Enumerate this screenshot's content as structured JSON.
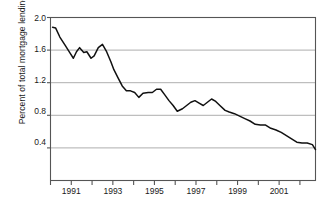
{
  "chart_data": {
    "type": "line",
    "title": "",
    "subtitle": "",
    "xlabel": "",
    "ylabel": "Percent of total mortgage lending",
    "ylim": [
      0.0,
      2.0
    ],
    "xlim": [
      1990.0,
      2002.75
    ],
    "yticks": [
      "2.0",
      "1.6",
      "1.2",
      "0.8",
      "0.4"
    ],
    "ytick_values": [
      2.0,
      1.6,
      1.2,
      0.8,
      0.4
    ],
    "xticks": [
      "1991",
      "1993",
      "1995",
      "1997",
      "1999",
      "2001"
    ],
    "xtick_values": [
      1991,
      1993,
      1995,
      1997,
      1999,
      2001
    ],
    "xtick_minor_values": [
      1990,
      1991,
      1992,
      1993,
      1994,
      1995,
      1996,
      1997,
      1998,
      1999,
      2000,
      2001,
      2002
    ],
    "grid": "horizontal",
    "legend": "none",
    "line_color": "#111111",
    "grid_color": "#999999",
    "axis_color": "#555555",
    "series": [
      {
        "name": "Percent of total mortgage lending",
        "x": [
          1990.1,
          1990.25,
          1990.45,
          1990.7,
          1990.95,
          1991.1,
          1991.25,
          1991.4,
          1991.6,
          1991.75,
          1991.95,
          1992.1,
          1992.3,
          1992.5,
          1992.7,
          1992.9,
          1993.05,
          1993.25,
          1993.45,
          1993.65,
          1993.85,
          1994.05,
          1994.25,
          1994.45,
          1994.7,
          1994.9,
          1995.1,
          1995.3,
          1995.5,
          1995.7,
          1995.9,
          1996.1,
          1996.35,
          1996.55,
          1996.75,
          1996.95,
          1997.15,
          1997.35,
          1997.55,
          1997.75,
          1997.95,
          1998.15,
          1998.4,
          1998.6,
          1998.85,
          1999.1,
          1999.35,
          1999.6,
          1999.85,
          2000.1,
          2000.35,
          2000.6,
          2000.85,
          2001.1,
          2001.35,
          2001.6,
          2001.85,
          2002.1,
          2002.35,
          2002.6,
          2002.75
        ],
        "y": [
          1.88,
          1.87,
          1.76,
          1.66,
          1.56,
          1.5,
          1.58,
          1.63,
          1.57,
          1.58,
          1.5,
          1.53,
          1.63,
          1.67,
          1.58,
          1.46,
          1.36,
          1.26,
          1.16,
          1.1,
          1.1,
          1.08,
          1.02,
          1.07,
          1.08,
          1.08,
          1.12,
          1.12,
          1.05,
          0.98,
          0.92,
          0.85,
          0.88,
          0.92,
          0.96,
          0.98,
          0.95,
          0.92,
          0.96,
          1.0,
          0.97,
          0.92,
          0.86,
          0.84,
          0.82,
          0.79,
          0.76,
          0.73,
          0.69,
          0.68,
          0.68,
          0.64,
          0.62,
          0.59,
          0.55,
          0.51,
          0.47,
          0.46,
          0.46,
          0.44,
          0.38
        ]
      }
    ]
  }
}
